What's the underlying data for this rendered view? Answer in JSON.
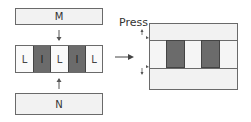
{
  "left": {
    "top_plate": {
      "label": "M"
    },
    "bottom_plate": {
      "label": "N"
    },
    "stack": [
      {
        "type": "L",
        "label": "L"
      },
      {
        "type": "I",
        "label": "I"
      },
      {
        "type": "L",
        "label": "L"
      },
      {
        "type": "I",
        "label": "I"
      },
      {
        "type": "L",
        "label": "L"
      }
    ]
  },
  "transition": {
    "label": "Press"
  },
  "right": {
    "description": "pressed assembly with two dark inserts between plates"
  },
  "colors": {
    "plate": "#f2f2f2",
    "dark_insert": "#6b6b6b",
    "border": "#6a6a6a"
  }
}
